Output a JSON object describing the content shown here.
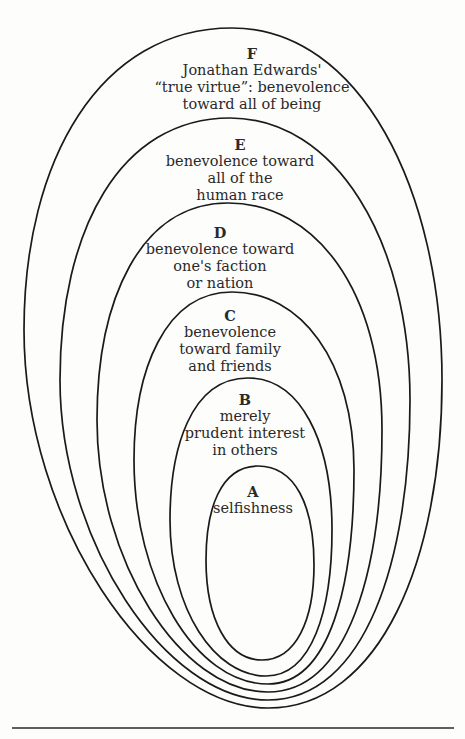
{
  "diagram": {
    "type": "nested-ovals",
    "levels": [
      {
        "id": "F",
        "letter": "F",
        "lines": [
          "Jonathan Edwards'",
          "“true virtue”: benevolence",
          "toward all of being"
        ]
      },
      {
        "id": "E",
        "letter": "E",
        "lines": [
          "benevolence toward",
          "all of the",
          "human race"
        ]
      },
      {
        "id": "D",
        "letter": "D",
        "lines": [
          "benevolence toward",
          "one's faction",
          "or nation"
        ]
      },
      {
        "id": "C",
        "letter": "C",
        "lines": [
          "benevolence",
          "toward family",
          "and friends"
        ]
      },
      {
        "id": "B",
        "letter": "B",
        "lines": [
          "merely",
          "prudent interest",
          "in others"
        ]
      },
      {
        "id": "A",
        "letter": "A",
        "lines": [
          "selfishness"
        ]
      }
    ],
    "colors": {
      "stroke": "#1a1a1a",
      "text": "#2a2a2a",
      "background": "#fdfdfc"
    }
  }
}
